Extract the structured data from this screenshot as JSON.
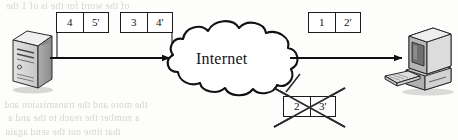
{
  "figure": {
    "width": 458,
    "height": 140,
    "background_color": "#fdfdfc",
    "ink_color": "#1c1c1c"
  },
  "cloud": {
    "label": "Internet",
    "outline_color": "#111111",
    "fill_color": "#ffffff"
  },
  "nodes": {
    "server": {
      "name": "server-tower",
      "face_color": "#d6d6d6",
      "side_color": "#9a9a9a",
      "top_color": "#efefef",
      "outline_color": "#2a2a2a"
    },
    "workstation": {
      "name": "desktop-computer",
      "monitor_color": "#cfcfcf",
      "screen_color": "#6f6f6f",
      "base_color": "#c4c4c4",
      "keyboard_color": "#d8d8d8",
      "outline_color": "#2a2a2a"
    }
  },
  "arrows": [
    {
      "id": "server-to-cloud",
      "from": "server",
      "to": "cloud",
      "color": "#111111"
    },
    {
      "id": "cloud-to-workstation",
      "from": "cloud",
      "to": "workstation",
      "color": "#111111"
    }
  ],
  "packets": [
    {
      "id": "packet-4-5",
      "seq": "4",
      "ack": "5'",
      "state": "in-flight",
      "x": 56,
      "y": 12,
      "w": 53,
      "h": 21
    },
    {
      "id": "packet-3-4",
      "seq": "3",
      "ack": "4'",
      "state": "in-flight",
      "x": 120,
      "y": 12,
      "w": 53,
      "h": 21
    },
    {
      "id": "packet-1-2",
      "seq": "1",
      "ack": "2'",
      "state": "delivered",
      "x": 308,
      "y": 12,
      "w": 53,
      "h": 21
    },
    {
      "id": "packet-2-3",
      "seq": "2",
      "ack": "3'",
      "state": "lost",
      "x": 283,
      "y": 96,
      "w": 53,
      "h": 21
    }
  ],
  "loss_marker": {
    "name": "cross-out-x",
    "applies_to": "packet-2-3",
    "color": "#2b2b2b"
  },
  "background_text": {
    "note": "faint illegible bleed-through text from reverse of scanned page",
    "lines": [
      "of the word for the is of 1 the",
      "the  more  and  the  transmission  and",
      "a number the reach to the and a",
      "that  time  out  the  send  again"
    ]
  }
}
